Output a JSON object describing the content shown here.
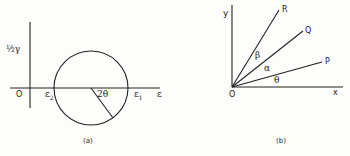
{
  "figure": {
    "panel_a": {
      "caption": "(a)",
      "y_axis_label": "½γ",
      "x_axis_label": "ε",
      "origin_label": "O",
      "circle_left_label": "ε",
      "circle_left_sub": "2",
      "circle_right_label": "ε",
      "circle_right_sub": "1",
      "angle_label": "2θ"
    },
    "panel_b": {
      "caption": "(b)",
      "y_axis_label": "y",
      "x_axis_label": "x",
      "origin_label": "O",
      "ray_labels": [
        "R",
        "Q",
        "P"
      ],
      "angle_labels": [
        "β",
        "α",
        "θ"
      ]
    },
    "colors": {
      "ink": "#222222",
      "paper": "#fdfdfb"
    }
  }
}
